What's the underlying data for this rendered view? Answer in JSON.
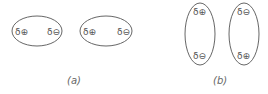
{
  "figure": {
    "panels": [
      {
        "caption": "(a)",
        "arrangement": "horizontal dipoles, aligned head-to-tail",
        "molecules": [
          {
            "left_label": "δ⊕",
            "right_label": "δ⊖"
          },
          {
            "left_label": "δ⊕",
            "right_label": "δ⊖"
          }
        ]
      },
      {
        "caption": "(b)",
        "arrangement": "vertical dipoles, antiparallel",
        "molecules": [
          {
            "top_label": "δ⊕",
            "bottom_label": "δ⊖"
          },
          {
            "top_label": "δ⊖",
            "bottom_label": "δ⊕"
          }
        ]
      }
    ]
  }
}
